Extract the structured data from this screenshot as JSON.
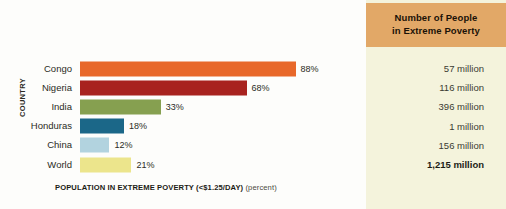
{
  "chart_data": {
    "type": "bar",
    "orientation": "horizontal",
    "title": "",
    "xlabel": "POPULATION IN EXTREME POVERTY (<$1.25/DAY)",
    "xlabel_unit": "(percent)",
    "ylabel": "COUNTRY",
    "categories": [
      "Congo",
      "Nigeria",
      "India",
      "Honduras",
      "China",
      "World"
    ],
    "values": [
      88,
      68,
      33,
      18,
      12,
      21
    ],
    "value_labels": [
      "88%",
      "68%",
      "33%",
      "18%",
      "12%",
      "21%"
    ],
    "xlim": [
      0,
      100
    ],
    "grid": false,
    "legend": false,
    "bar_colors": [
      "#e8682a",
      "#a8231f",
      "#86a050",
      "#1b6788",
      "#b2d3df",
      "#ece58c"
    ]
  },
  "table": {
    "header_line1": "Number of People",
    "header_line2": "in Extreme Poverty",
    "header_color": "#e2a867",
    "panel_color": "#f4f3dc",
    "rows": [
      {
        "value": "57 million",
        "bold": false
      },
      {
        "value": "116 million",
        "bold": false
      },
      {
        "value": "396 million",
        "bold": false
      },
      {
        "value": "1 million",
        "bold": false
      },
      {
        "value": "156 million",
        "bold": false
      },
      {
        "value": "1,215 million",
        "bold": true
      }
    ]
  }
}
